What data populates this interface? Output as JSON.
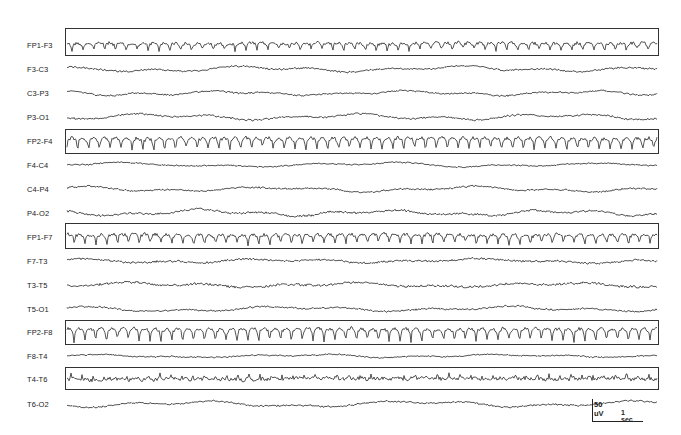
{
  "chart_data": {
    "type": "line",
    "title": "",
    "xlabel": "",
    "ylabel": "",
    "grid": false,
    "legend": null,
    "channels": [
      {
        "name": "FP1-F3",
        "y": 45,
        "highlighted": true,
        "pattern": "spikes",
        "amp": 5.5,
        "freq": 0.092,
        "noise": 1.5
      },
      {
        "name": "F3-C3",
        "y": 69,
        "highlighted": false,
        "pattern": "slow",
        "amp": 2.5,
        "freq": 0.03,
        "noise": 1.0
      },
      {
        "name": "C3-P3",
        "y": 93,
        "highlighted": false,
        "pattern": "slow",
        "amp": 2.2,
        "freq": 0.035,
        "noise": 1.0
      },
      {
        "name": "P3-O1",
        "y": 117,
        "highlighted": false,
        "pattern": "slow",
        "amp": 2.8,
        "freq": 0.03,
        "noise": 1.1
      },
      {
        "name": "FP2-F4",
        "y": 141,
        "highlighted": true,
        "pattern": "spikes",
        "amp": 9.0,
        "freq": 0.092,
        "noise": 1.6
      },
      {
        "name": "F4-C4",
        "y": 165,
        "highlighted": false,
        "pattern": "slow",
        "amp": 2.0,
        "freq": 0.025,
        "noise": 0.8
      },
      {
        "name": "C4-P4",
        "y": 189,
        "highlighted": false,
        "pattern": "slow",
        "amp": 2.4,
        "freq": 0.03,
        "noise": 1.0
      },
      {
        "name": "P4-O2",
        "y": 213,
        "highlighted": false,
        "pattern": "slow",
        "amp": 2.8,
        "freq": 0.035,
        "noise": 1.2
      },
      {
        "name": "FP1-F7",
        "y": 237,
        "highlighted": true,
        "pattern": "spikes",
        "amp": 7.5,
        "freq": 0.092,
        "noise": 1.6
      },
      {
        "name": "F7-T3",
        "y": 261,
        "highlighted": false,
        "pattern": "slow",
        "amp": 2.0,
        "freq": 0.03,
        "noise": 1.2
      },
      {
        "name": "T3-T5",
        "y": 285,
        "highlighted": false,
        "pattern": "slow",
        "amp": 2.2,
        "freq": 0.03,
        "noise": 1.4
      },
      {
        "name": "T5-O1",
        "y": 309,
        "highlighted": false,
        "pattern": "slow",
        "amp": 2.4,
        "freq": 0.028,
        "noise": 1.0
      },
      {
        "name": "FP2-F8",
        "y": 332,
        "highlighted": true,
        "pattern": "spikes",
        "amp": 9.5,
        "freq": 0.092,
        "noise": 1.6
      },
      {
        "name": "F8-T4",
        "y": 356,
        "highlighted": false,
        "pattern": "slow",
        "amp": 1.5,
        "freq": 0.03,
        "noise": 0.8
      },
      {
        "name": "T4-T6",
        "y": 379,
        "highlighted": true,
        "pattern": "sharp",
        "amp": 4.0,
        "freq": 0.09,
        "noise": 1.6
      },
      {
        "name": "T6-O2",
        "y": 404,
        "highlighted": false,
        "pattern": "slow",
        "amp": 2.8,
        "freq": 0.028,
        "noise": 1.0
      }
    ],
    "highlight_boxes": [
      {
        "channel": "FP1-F3",
        "top": 28,
        "height": 28
      },
      {
        "channel": "FP2-F4",
        "top": 129,
        "height": 25
      },
      {
        "channel": "FP1-F7",
        "top": 223,
        "height": 26
      },
      {
        "channel": "FP2-F8",
        "top": 320,
        "height": 25
      },
      {
        "channel": "T4-T6",
        "top": 367,
        "height": 23
      }
    ],
    "trace_x_range": [
      67,
      657
    ],
    "box_x_range": [
      65,
      659
    ],
    "scale_bar": {
      "amplitude": "50 uV",
      "time": "1 sec"
    }
  },
  "scale": {
    "amplitude_label": "50 uV",
    "time_label": "1 sec"
  }
}
